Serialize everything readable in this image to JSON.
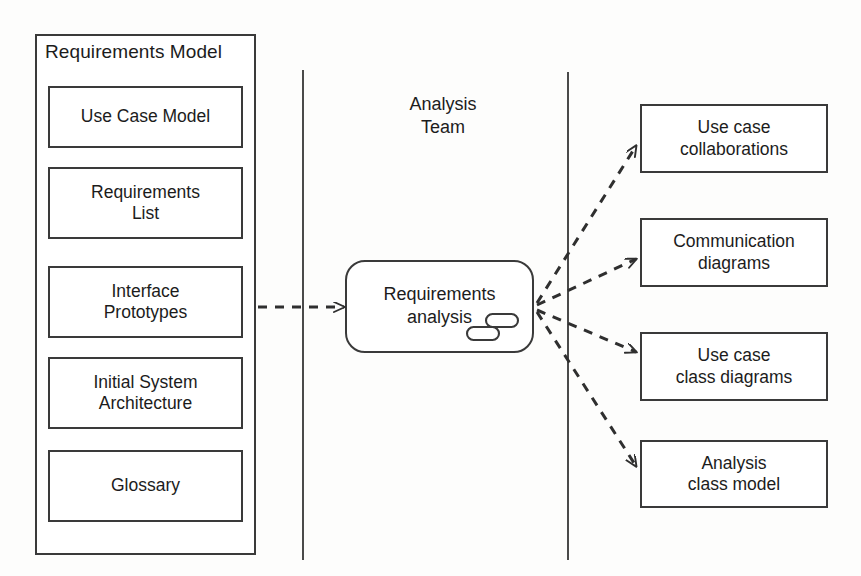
{
  "diagram": {
    "stroke_color": "#3a3a3a",
    "text_color": "#1c1c1c",
    "background_color": "#fdfdfc"
  },
  "left_package": {
    "title": "Requirements Model",
    "artifacts": [
      {
        "label": "Use Case Model"
      },
      {
        "label": "Requirements\nList"
      },
      {
        "label": "Interface\nPrototypes"
      },
      {
        "label": "Initial System\nArchitecture"
      },
      {
        "label": "Glossary"
      }
    ]
  },
  "lane": {
    "label": "Analysis\nTeam",
    "divider_count": 2
  },
  "activity": {
    "label": "Requirements\nanalysis",
    "icon": "subactivity-icon"
  },
  "outputs": [
    {
      "label": "Use case\ncollaborations"
    },
    {
      "label": "Communication\ndiagrams"
    },
    {
      "label": "Use case\nclass diagrams"
    },
    {
      "label": "Analysis\nclass model"
    }
  ],
  "connectors": {
    "input_label": "",
    "style": "dashed-arrow",
    "count": 5
  }
}
